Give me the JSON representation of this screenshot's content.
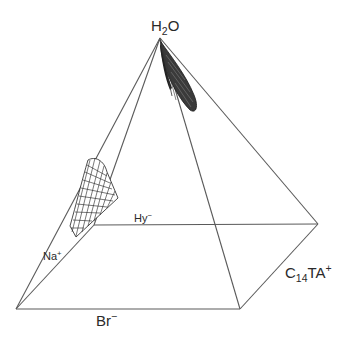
{
  "diagram": {
    "type": "square pyramid phase diagram",
    "labels": {
      "apex": {
        "base": "H",
        "sub": "2",
        "tail": "O"
      },
      "back_left": {
        "base": "Hy",
        "sup": "−"
      },
      "left": {
        "base": "Na",
        "sup": "+"
      },
      "right": {
        "base": "C",
        "sub": "14",
        "tail": "TA",
        "sup": "+"
      },
      "front": {
        "base": "Br",
        "sup": "−"
      }
    },
    "vertices": {
      "apex": [
        160,
        38
      ],
      "back_left": [
        94,
        225
      ],
      "back_right": [
        318,
        224
      ],
      "front_left": [
        16,
        309
      ],
      "front_right": [
        240,
        309
      ]
    },
    "line_color": "#555555",
    "region_color": "#222222",
    "regions": [
      {
        "name": "water-rich phase region near H2O apex",
        "style": "dense hatch"
      },
      {
        "name": "phase region on Na+ / Hy- face",
        "style": "mesh grid"
      }
    ]
  }
}
